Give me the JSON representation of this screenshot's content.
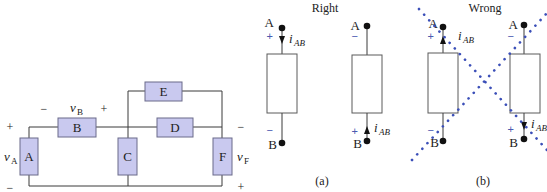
{
  "circuit": {
    "components": [
      {
        "id": "A",
        "label": "A"
      },
      {
        "id": "B",
        "label": "B"
      },
      {
        "id": "C",
        "label": "C"
      },
      {
        "id": "D",
        "label": "D"
      },
      {
        "id": "E",
        "label": "E"
      },
      {
        "id": "F",
        "label": "F"
      }
    ],
    "voltage_labels": {
      "vA": {
        "v": "v",
        "sub": "A",
        "top_sign": "+",
        "bottom_sign": "−"
      },
      "vB": {
        "v": "v",
        "sub": "B",
        "left_sign": "−",
        "right_sign": "+"
      },
      "vF": {
        "v": "v",
        "sub": "F",
        "top_sign": "−",
        "bottom_sign": "+"
      }
    },
    "colors": {
      "component_fill": "#c9c9ef",
      "component_border": "#6a6a8a"
    }
  },
  "panel_a": {
    "title": "Right",
    "caption": "(a)",
    "elements": [
      {
        "node_top": "A",
        "node_bottom": "B",
        "top_sign": "+",
        "bottom_sign": "−",
        "current": "i",
        "current_sub": "AB",
        "arrow": "down"
      },
      {
        "node_top": "A",
        "node_bottom": "B",
        "top_sign": "−",
        "bottom_sign": "+",
        "current": "i",
        "current_sub": "AB",
        "arrow": "up"
      }
    ]
  },
  "panel_b": {
    "title": "Wrong",
    "caption": "(b)",
    "elements": [
      {
        "node_top": "A",
        "node_bottom": "B",
        "top_sign": "+",
        "bottom_sign": "−",
        "current": "i",
        "current_sub": "AB",
        "arrow": "up"
      },
      {
        "node_top": "A",
        "node_bottom": "B",
        "top_sign": "−",
        "bottom_sign": "+",
        "current": "i",
        "current_sub": "AB",
        "arrow": "down"
      }
    ],
    "cross_color": "#3b4fb8"
  }
}
